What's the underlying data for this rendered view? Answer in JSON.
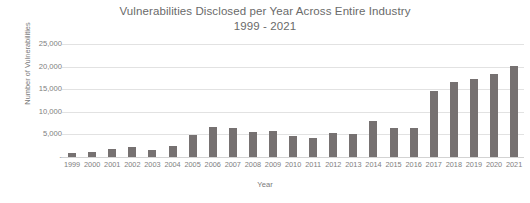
{
  "chart_data": {
    "type": "bar",
    "title": "Vulnerabilities Disclosed per Year Across Entire Industry",
    "subtitle": "1999 - 2021",
    "xlabel": "Year",
    "ylabel": "Number of Vulnerabilities",
    "ylim": [
      0,
      25000
    ],
    "grid": true,
    "legend": null,
    "bar_color": "#767171",
    "gridline_color": "#e2e2e2",
    "text_color": "#7a7a7a",
    "ytick_labels": [
      "25,000",
      "20,000",
      "15,000",
      "10,000",
      "5,000",
      "-"
    ],
    "ytick_values": [
      25000,
      20000,
      15000,
      10000,
      5000,
      0
    ],
    "categories": [
      "1999",
      "2000",
      "2001",
      "2002",
      "2003",
      "2004",
      "2005",
      "2006",
      "2007",
      "2008",
      "2009",
      "2010",
      "2011",
      "2012",
      "2013",
      "2014",
      "2015",
      "2016",
      "2017",
      "2018",
      "2019",
      "2020",
      "2021"
    ],
    "values": [
      900,
      1020,
      1670,
      2160,
      1530,
      2450,
      4930,
      6600,
      6510,
      5630,
      5730,
      4650,
      4150,
      5290,
      5190,
      7940,
      6480,
      6450,
      14650,
      16500,
      17300,
      18350,
      20150
    ]
  }
}
